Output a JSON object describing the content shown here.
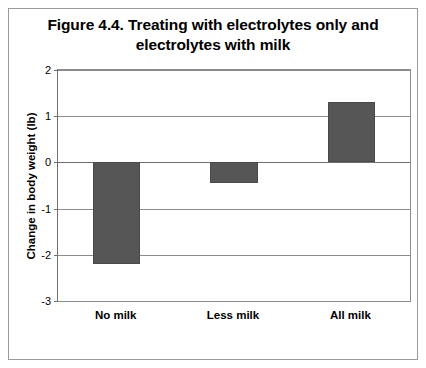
{
  "figure": {
    "title": "Figure 4.4. Treating with electrolytes only and electrolytes with milk"
  },
  "chart_data": {
    "type": "bar",
    "title": "Figure 4.4. Treating with electrolytes only and electrolytes with milk",
    "categories": [
      "No milk",
      "Less milk",
      "All milk"
    ],
    "values": [
      -2.2,
      -0.45,
      1.3
    ],
    "xlabel": "",
    "ylabel": "Change in body weight (lb)",
    "ylim": [
      -3,
      2
    ],
    "yticks": [
      2,
      1,
      0,
      -1,
      -2,
      -3
    ],
    "ytick_labels": [
      "2",
      "1",
      "0",
      "-1",
      "-2",
      "-3"
    ],
    "grid": true,
    "legend": "none",
    "bar_color": "#565656",
    "plot_border_color": "#8c8c8c",
    "frame_color": "#9a9a9a",
    "background": "#ffffff"
  }
}
